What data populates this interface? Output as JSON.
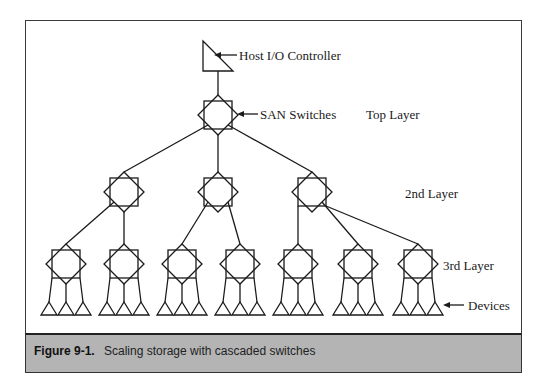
{
  "diagram": {
    "labels": {
      "host": "Host I/O Controller",
      "switches": "SAN Switches",
      "top_layer": "Top Layer",
      "second_layer": "2nd Layer",
      "third_layer": "3rd Layer",
      "devices": "Devices"
    },
    "nodes": {
      "host_controller": {
        "type": "host-triangle",
        "x": 218,
        "y": 56
      },
      "top_switch": {
        "type": "switch",
        "x": 218,
        "y": 115
      },
      "second_layer_switches": [
        {
          "x": 124,
          "y": 192
        },
        {
          "x": 218,
          "y": 192
        },
        {
          "x": 312,
          "y": 192
        }
      ],
      "third_layer_switches": [
        {
          "x": 66,
          "y": 264,
          "parent": 0
        },
        {
          "x": 124,
          "y": 264,
          "parent": 0
        },
        {
          "x": 182,
          "y": 264,
          "parent": 1
        },
        {
          "x": 240,
          "y": 264,
          "parent": 1
        },
        {
          "x": 298,
          "y": 264,
          "parent": 2
        },
        {
          "x": 358,
          "y": 264,
          "parent": 2
        },
        {
          "x": 418,
          "y": 264,
          "parent": 2
        }
      ],
      "devices_per_switch": 3
    }
  },
  "caption": {
    "number": "Figure 9-1.",
    "text": "Scaling storage with cascaded switches"
  },
  "colors": {
    "line": "#1a1a1a",
    "caption_bg": "#b4b4b4",
    "frame": "#3a3a3a"
  }
}
